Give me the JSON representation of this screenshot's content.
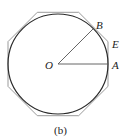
{
  "figure": {
    "caption": "(b)",
    "labels": {
      "center": "O",
      "point_a": "A",
      "point_b": "B",
      "point_e": "E"
    },
    "colors": {
      "circle": "#2a2a2a",
      "octagon": "#9a9a9a",
      "radius": "#555555",
      "text": "#222222"
    }
  }
}
